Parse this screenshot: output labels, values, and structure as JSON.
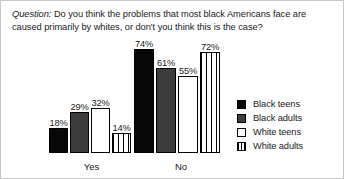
{
  "question": {
    "label": "Question:",
    "text": "Do you think the problems that most black Americans face are caused primarily by whites, or don't you think this is the case?"
  },
  "chart_data": {
    "type": "bar",
    "title": "",
    "xlabel": "",
    "ylabel": "",
    "ylim": [
      0,
      80
    ],
    "grid": false,
    "legend_position": "right",
    "categories": [
      "Yes",
      "No"
    ],
    "series": [
      {
        "name": "Black teens",
        "values": [
          18,
          74
        ],
        "color": "#080808",
        "pattern": "solid"
      },
      {
        "name": "Black adults",
        "values": [
          29,
          61
        ],
        "color": "#3c3c3c",
        "pattern": "solid"
      },
      {
        "name": "White teens",
        "values": [
          32,
          55
        ],
        "color": "#ffffff",
        "pattern": "outline"
      },
      {
        "name": "White adults",
        "values": [
          14,
          72
        ],
        "color": "#ffffff",
        "pattern": "vertical-stripes"
      }
    ],
    "value_labels": [
      "18%",
      "29%",
      "32%",
      "14%",
      "74%",
      "61%",
      "55%",
      "72%"
    ]
  }
}
